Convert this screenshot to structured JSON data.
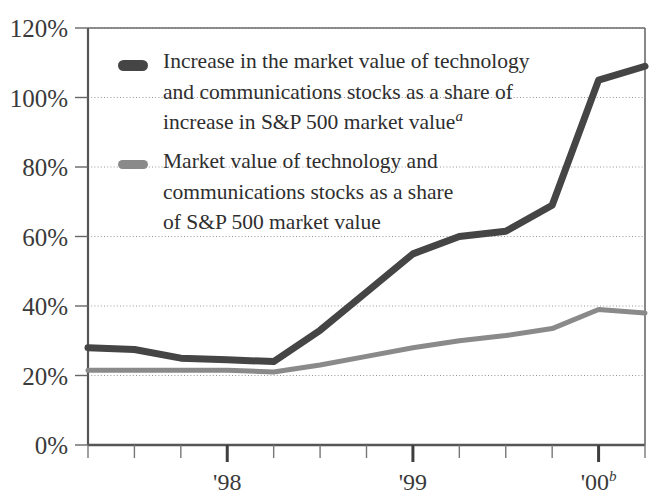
{
  "chart_data": {
    "type": "line",
    "title": "",
    "subtitle": "",
    "xlabel": "",
    "ylabel": "",
    "ylim": [
      0,
      120
    ],
    "ytick_labels": [
      "0%",
      "20%",
      "40%",
      "60%",
      "80%",
      "100%",
      "120%"
    ],
    "ytick_values": [
      0,
      20,
      40,
      60,
      80,
      100,
      120
    ],
    "xtick_labels": [
      "'98",
      "'99",
      "'00"
    ],
    "xtick_superscripts": [
      "",
      "",
      "b"
    ],
    "xtick_positions": [
      3,
      7,
      11
    ],
    "x": [
      0,
      1,
      2,
      3,
      4,
      5,
      6,
      7,
      8,
      9,
      10,
      11,
      12
    ],
    "grid": "horizontal-dotted",
    "legend_position": "upper-left-inside",
    "minor_ticks": true,
    "series": [
      {
        "name": "Increase in the market value of technology and communications stocks as a share of increase in S&P 500 market value",
        "color": "#454545",
        "width": 7,
        "values": [
          28,
          27.5,
          25,
          24.5,
          24,
          33,
          44,
          55,
          60,
          61.5,
          69,
          105,
          109
        ]
      },
      {
        "name": "Market value of technology and communications stocks as a share of S&P 500 market value",
        "color": "#8a8a8a",
        "width": 5,
        "values": [
          21.5,
          21.5,
          21.5,
          21.5,
          21,
          23,
          25.5,
          28,
          30,
          31.5,
          33.5,
          39,
          38
        ]
      }
    ]
  },
  "legend": {
    "entries": [
      {
        "swatch_name": "legend-swatch-dark",
        "color": "#454545",
        "lines": [
          "Increase in the market value of technology",
          "and communications stocks as a share of",
          "increase in S&P 500 market value"
        ],
        "superscript": "a"
      },
      {
        "swatch_name": "legend-swatch-gray",
        "color": "#8a8a8a",
        "lines": [
          "Market value of technology and",
          "communications stocks as a share",
          "of S&P 500 market value"
        ],
        "superscript": ""
      }
    ]
  },
  "axis": {
    "y_labels": [
      "120%",
      "100%",
      "80%",
      "60%",
      "40%",
      "20%",
      "0%"
    ],
    "x_labels": [
      "'98",
      "'99",
      "'00"
    ],
    "x_superscript_last": "b"
  },
  "colors": {
    "series_dark": "#454545",
    "series_gray": "#8a8a8a",
    "axis": "#555555",
    "grid": "#9a9a9a",
    "text": "#2b2b2b"
  }
}
